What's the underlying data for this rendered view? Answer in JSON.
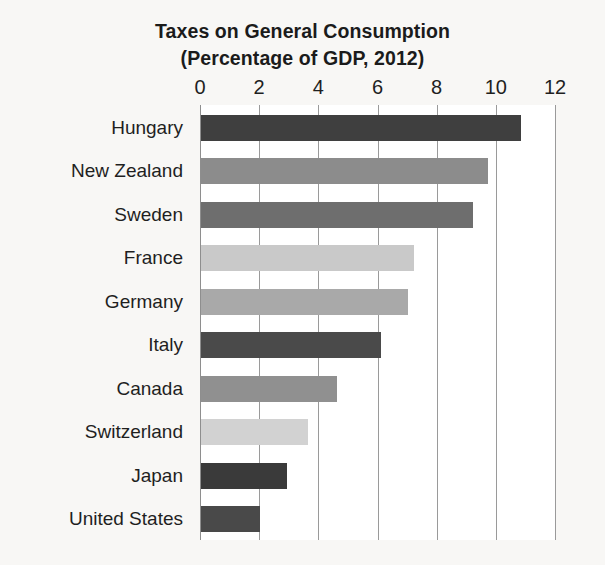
{
  "chart_data": {
    "type": "bar",
    "orientation": "horizontal",
    "title": "Taxes on General Consumption",
    "subtitle": "(Percentage of GDP, 2012)",
    "xlabel": "",
    "ylabel": "",
    "xlim": [
      0,
      12
    ],
    "grid": true,
    "legend": "none",
    "xticks": [
      "0",
      "2",
      "4",
      "6",
      "8",
      "10",
      "12"
    ],
    "xtick_values": [
      0,
      2,
      4,
      6,
      8,
      10,
      12
    ],
    "categories": [
      "Hungary",
      "New Zealand",
      "Sweden",
      "France",
      "Germany",
      "Italy",
      "Canada",
      "Switzerland",
      "Japan",
      "United States"
    ],
    "values": [
      10.8,
      9.7,
      9.2,
      7.2,
      7.0,
      6.1,
      4.6,
      3.6,
      2.9,
      2.0
    ],
    "bar_colors": [
      "#3f3f3f",
      "#8c8c8c",
      "#6e6e6e",
      "#c9c9c9",
      "#a9a9a9",
      "#4a4a4a",
      "#909090",
      "#d2d2d2",
      "#3a3a3a",
      "#494949"
    ]
  },
  "colors": {
    "page_background": "#f8f7f5",
    "plot_background": "#ffffff",
    "gridline": "#9a9a9a",
    "text": "#1f1f1f"
  }
}
